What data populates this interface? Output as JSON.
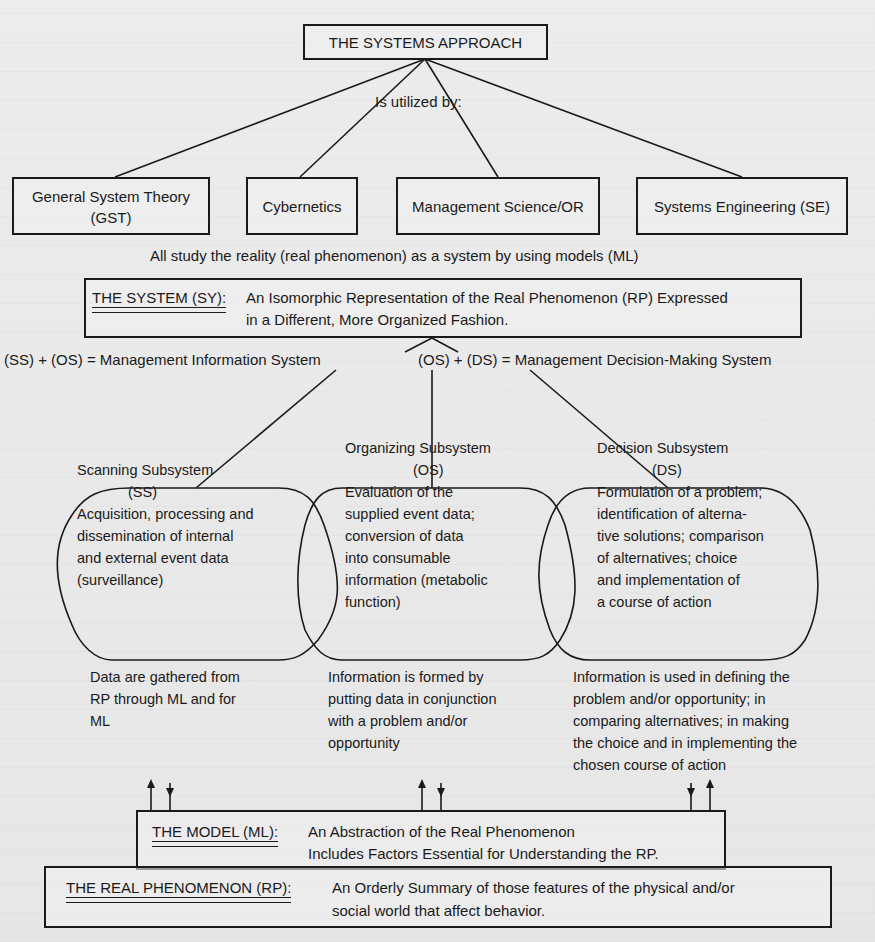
{
  "title": "THE SYSTEMS APPROACH",
  "utilized_by_label": "Is utilized by:",
  "disciplines": [
    {
      "line1": "General System Theory",
      "line2": "(GST)"
    },
    {
      "line1": "Cybernetics"
    },
    {
      "line1": "Management Science/OR"
    },
    {
      "line1": "Systems Engineering (SE)"
    }
  ],
  "all_study_caption": "All study the reality (real phenomenon) as a system by using models (ML)",
  "system_box": {
    "heading": "THE SYSTEM (SY):",
    "line1": "An Isomorphic Representation of the Real Phenomenon (RP) Expressed",
    "line2": "in a Different, More Organized Fashion."
  },
  "equations": {
    "mis": "(SS) + (OS) = Management Information System",
    "mdms": "(OS) + (DS) = Management Decision-Making System"
  },
  "subsystems": [
    {
      "name": "Scanning Subsystem",
      "abbr": "(SS)",
      "desc": [
        "Acquisition, processing and",
        "dissemination of internal",
        "and external event data",
        "(surveillance)"
      ]
    },
    {
      "name": "Organizing Subsystem",
      "abbr": "(OS)",
      "desc": [
        "Evaluation of the",
        "supplied event data;",
        "conversion of data",
        "into consumable",
        "information (metabolic",
        "function)"
      ]
    },
    {
      "name": "Decision Subsystem",
      "abbr": "(DS)",
      "desc": [
        "Formulation of a problem;",
        "identification of alterna-",
        "tive solutions; comparison",
        "of alternatives; choice",
        "and implementation of",
        "a course of action"
      ]
    }
  ],
  "notes": [
    [
      "Data are gathered from",
      "RP through ML and for",
      "ML"
    ],
    [
      "Information is formed by",
      "putting data in conjunction",
      "with a problem and/or",
      "opportunity"
    ],
    [
      "Information is used in defining the",
      "problem and/or opportunity; in",
      "comparing alternatives; in making",
      "the choice and in implementing the",
      "chosen course of action"
    ]
  ],
  "model_box": {
    "heading": "THE MODEL (ML):",
    "line1": "An Abstraction of the Real Phenomenon",
    "line2": "Includes Factors Essential for Understanding the RP."
  },
  "rp_box": {
    "heading": "THE REAL PHENOMENON (RP):",
    "line1": "An Orderly Summary of those features of the physical and/or",
    "line2": "social world that affect behavior."
  }
}
